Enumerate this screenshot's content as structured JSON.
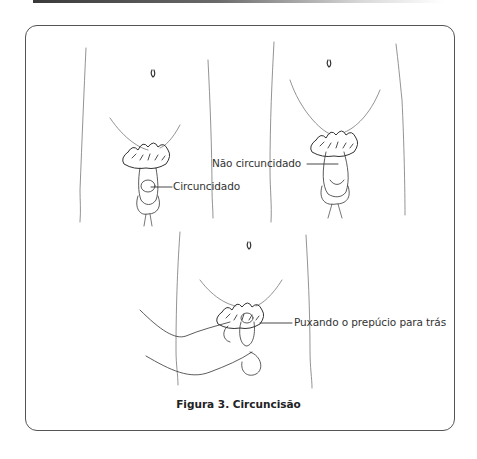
{
  "figure": {
    "caption": "Figura 3. Circuncisão",
    "labels": {
      "circumcised": "Circuncidado",
      "uncircumcised": "Não circuncidado",
      "retracting": "Puxando o prepúcio para trás"
    },
    "colors": {
      "frame": "#555555",
      "line": "#444444",
      "text": "#333333"
    }
  }
}
